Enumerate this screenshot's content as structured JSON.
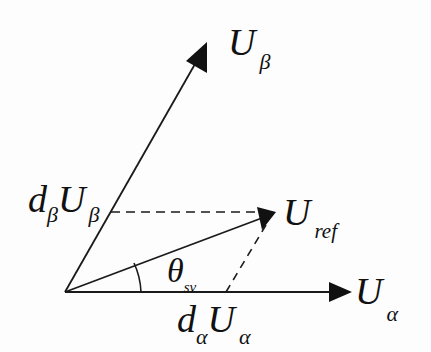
{
  "diagram": {
    "vectors": [
      {
        "id": "U_beta",
        "label_main": "U",
        "label_sub": "β",
        "from": [
          65,
          292
        ],
        "to": [
          207,
          42
        ],
        "style": "solid",
        "arrow": true
      },
      {
        "id": "U_alpha",
        "label_main": "U",
        "label_sub": "α",
        "from": [
          65,
          292
        ],
        "to": [
          352,
          292
        ],
        "style": "solid",
        "arrow": true
      },
      {
        "id": "U_ref",
        "label_main": "U",
        "label_sub": "ref",
        "from": [
          65,
          292
        ],
        "to": [
          276,
          212
        ],
        "style": "solid",
        "arrow": true
      }
    ],
    "projections": [
      {
        "id": "beta_projection",
        "from": [
          111,
          212
        ],
        "to": [
          276,
          212
        ],
        "style": "dashed"
      },
      {
        "id": "alpha_projection",
        "from": [
          226,
          292
        ],
        "to": [
          268,
          220
        ],
        "style": "dashed"
      }
    ],
    "labels": {
      "u_beta": {
        "main": "U",
        "sub": "β"
      },
      "u_alpha": {
        "main": "U",
        "sub": "α"
      },
      "u_ref": {
        "main": "U",
        "sub": "ref"
      },
      "d_beta_u_beta": {
        "d": "d",
        "d_sub": "β",
        "main": "U",
        "sub": "β"
      },
      "d_alpha_u_alpha": {
        "d": "d",
        "d_sub": "α",
        "main": "U",
        "sub": "α"
      },
      "theta": {
        "main": "θ",
        "sub": "sv"
      }
    },
    "angle": {
      "name": "theta_sv",
      "center": [
        65,
        292
      ],
      "radius": 78
    },
    "colors": {
      "stroke": "#1a1a1a",
      "background": "#fdfdfd"
    }
  }
}
